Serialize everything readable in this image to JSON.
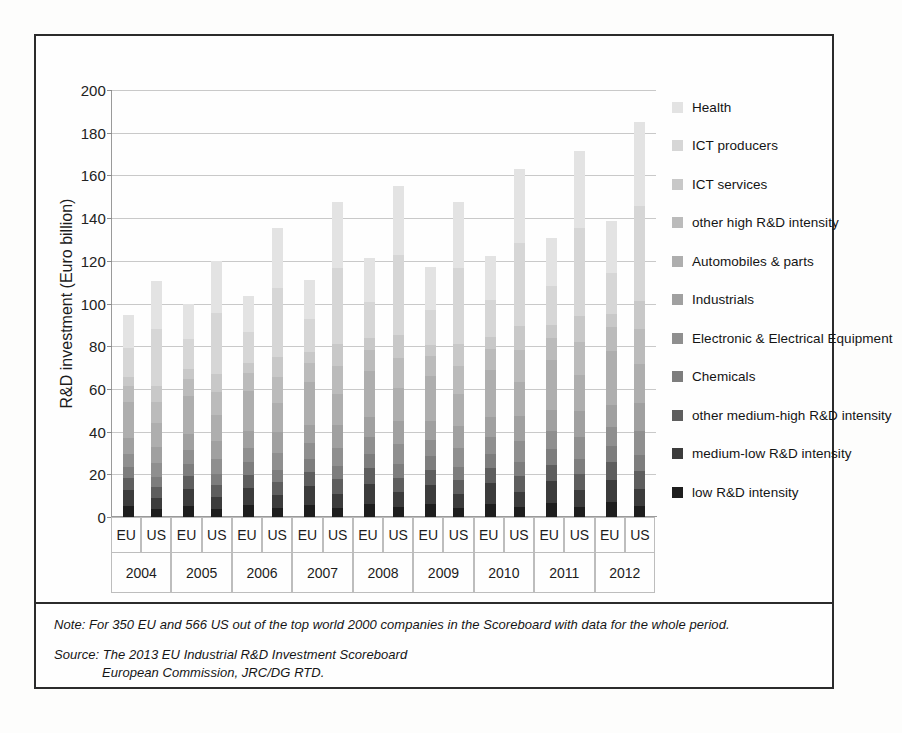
{
  "figure": {
    "y_axis_title": "R&D investment (Euro billion)",
    "y_ticks": [
      "200",
      "180",
      "160",
      "140",
      "120",
      "100",
      "80",
      "60",
      "40",
      "20",
      "0"
    ],
    "group_label_eu": "EU",
    "group_label_us": "US"
  },
  "legend": {
    "items": [
      {
        "label": "Health",
        "color": "#e3e3e3"
      },
      {
        "label": "ICT producers",
        "color": "#d6d6d6"
      },
      {
        "label": "ICT services",
        "color": "#c8c8c8"
      },
      {
        "label": "other high R&D intensity",
        "color": "#bbbbbb"
      },
      {
        "label": "Automobiles & parts",
        "color": "#aeaeae"
      },
      {
        "label": "Industrials",
        "color": "#a0a0a0"
      },
      {
        "label": "Electronic & Electrical Equipment",
        "color": "#8f8f8f"
      },
      {
        "label": "Chemicals",
        "color": "#7d7d7d"
      },
      {
        "label": "other medium-high R&D intensity",
        "color": "#5e5e5e"
      },
      {
        "label": "medium-low R&D intensity",
        "color": "#3c3c3c"
      },
      {
        "label": "low R&D intensity",
        "color": "#1e1e1e"
      }
    ]
  },
  "footnote": {
    "note_label": "Note:",
    "note_text": "For 350 EU and 566 US out of the top world 2000 companies in the Scoreboard with data for the whole period.",
    "source_label": "Source:",
    "source_line_1": "The 2013 EU Industrial R&D Investment Scoreboard",
    "source_line_2": "European Commission, JRC/DG RTD."
  },
  "chart_data": {
    "type": "bar",
    "subtype": "stacked-bar",
    "title": "",
    "xlabel": "",
    "ylabel": "R&D investment (Euro billion)",
    "ylim": [
      0,
      200
    ],
    "ytick_step": 20,
    "grid": true,
    "legend_position": "right",
    "categories": [
      "2004 EU",
      "2004 US",
      "2005 EU",
      "2005 US",
      "2006 EU",
      "2006 US",
      "2007 EU",
      "2007 US",
      "2008 EU",
      "2008 US",
      "2009 EU",
      "2009 US",
      "2010 EU",
      "2010 US",
      "2011 EU",
      "2011 US",
      "2012 EU",
      "2012 US"
    ],
    "years": [
      "2004",
      "2005",
      "2006",
      "2007",
      "2008",
      "2009",
      "2010",
      "2011",
      "2012"
    ],
    "regions": [
      "EU",
      "US"
    ],
    "totals": [
      94.5,
      110.5,
      100.0,
      120.0,
      104.5,
      135.5,
      112.0,
      147.5,
      121.5,
      155.0,
      117.0,
      147.5,
      122.5,
      163.0,
      130.5,
      171.5,
      138.5,
      185.0
    ],
    "series": [
      {
        "name": "low R&D intensity",
        "color": "#1e1e1e",
        "values": [
          5.0,
          3.6,
          5.2,
          3.8,
          5.4,
          4.1,
          5.7,
          4.3,
          6.1,
          4.5,
          5.9,
          4.3,
          6.2,
          4.7,
          6.6,
          4.9,
          6.9,
          5.2
        ]
      },
      {
        "name": "medium-low R&D intensity",
        "color": "#3c3c3c",
        "values": [
          7.5,
          5.4,
          7.9,
          5.8,
          8.2,
          6.3,
          8.8,
          6.7,
          9.6,
          7.0,
          9.1,
          6.6,
          9.5,
          7.2,
          10.1,
          7.6,
          10.6,
          8.0
        ]
      },
      {
        "name": "other medium-high R&D intensity",
        "color": "#5e5e5e",
        "values": [
          5.6,
          5.0,
          5.9,
          5.4,
          6.2,
          6.1,
          6.6,
          6.6,
          7.2,
          7.0,
          6.9,
          6.6,
          7.2,
          7.3,
          7.7,
          7.7,
          8.1,
          8.3
        ]
      },
      {
        "name": "Chemicals",
        "color": "#7d7d7d",
        "values": [
          5.4,
          4.6,
          5.7,
          5.0,
          5.9,
          5.6,
          6.3,
          6.1,
          6.8,
          6.4,
          6.5,
          6.1,
          6.8,
          6.8,
          7.3,
          7.1,
          7.7,
          7.7
        ]
      },
      {
        "name": "Electronic & Electrical Equipment",
        "color": "#8f8f8f",
        "values": [
          6.2,
          6.6,
          6.5,
          7.2,
          6.8,
          8.1,
          7.3,
          8.8,
          7.9,
          9.3,
          7.6,
          8.8,
          8.0,
          9.7,
          8.5,
          10.2,
          9.0,
          11.0
        ]
      },
      {
        "name": "Industrials",
        "color": "#a0a0a0",
        "values": [
          7.1,
          7.8,
          7.5,
          8.5,
          7.8,
          9.6,
          8.4,
          10.4,
          9.1,
          10.9,
          8.8,
          10.4,
          9.2,
          11.5,
          9.8,
          12.1,
          10.4,
          13.0
        ]
      },
      {
        "name": "Automobiles & parts",
        "color": "#aeaeae",
        "values": [
          17.0,
          11.0,
          18.0,
          12.0,
          18.8,
          13.5,
          20.2,
          14.7,
          21.9,
          15.4,
          21.1,
          14.7,
          22.1,
          16.2,
          23.5,
          17.1,
          25.0,
          18.4
        ]
      },
      {
        "name": "other high R&D intensity",
        "color": "#bbbbbb",
        "values": [
          7.6,
          9.9,
          8.0,
          10.8,
          8.4,
          12.2,
          9.0,
          13.3,
          9.7,
          14.0,
          9.4,
          13.3,
          9.8,
          14.7,
          10.4,
          15.4,
          11.1,
          16.7
        ]
      },
      {
        "name": "ICT services",
        "color": "#c8c8c8",
        "values": [
          4.3,
          7.7,
          4.5,
          8.4,
          4.7,
          9.5,
          5.0,
          10.3,
          5.5,
          10.9,
          5.3,
          10.3,
          5.5,
          11.4,
          5.9,
          12.0,
          6.2,
          13.0
        ]
      },
      {
        "name": "ICT producers",
        "color": "#d6d6d6",
        "values": [
          13.3,
          26.5,
          14.0,
          28.8,
          14.7,
          32.5,
          15.7,
          35.4,
          17.0,
          37.2,
          16.4,
          35.4,
          17.2,
          39.1,
          18.3,
          41.2,
          19.4,
          44.4
        ]
      },
      {
        "name": "Health",
        "color": "#e3e3e3",
        "values": [
          15.5,
          22.4,
          16.8,
          24.3,
          16.6,
          28.0,
          18.0,
          30.9,
          20.7,
          32.4,
          20.0,
          31.0,
          21.0,
          34.4,
          22.4,
          36.2,
          24.1,
          39.3
        ]
      }
    ]
  }
}
